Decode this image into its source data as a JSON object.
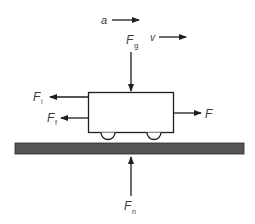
{
  "diagram": {
    "type": "free-body-diagram",
    "colors": {
      "line": "#1e1e1e",
      "ground": "#555555",
      "text": "#3a3a3a"
    },
    "labels": {
      "acceleration": "a",
      "velocity": "v",
      "gravity": {
        "main": "F",
        "sub": "g"
      },
      "inertia": {
        "main": "F",
        "sub": "i"
      },
      "friction": {
        "main": "F",
        "sub": "f"
      },
      "applied": {
        "main": "F",
        "sub": ""
      },
      "normal": {
        "main": "F",
        "sub": "n"
      }
    }
  }
}
